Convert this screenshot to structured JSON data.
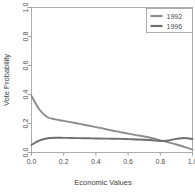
{
  "chart_data": {
    "type": "line",
    "title": "",
    "subtitle": "",
    "xlabel": "Economic Values",
    "ylabel": "Vote Probability",
    "xlim": [
      0.0,
      1.0
    ],
    "ylim": [
      0.0,
      1.0
    ],
    "grid": false,
    "legend_position": "top-right",
    "x_ticks": [
      "0.0",
      "0.2",
      "0.4",
      "0.6",
      "0.8",
      "1.0"
    ],
    "x_tick_values": [
      0.0,
      0.2,
      0.4,
      0.6,
      0.8,
      1.0
    ],
    "y_ticks": [
      "0.0",
      "0.2",
      "0.4",
      "0.6",
      "0.8",
      "1.0"
    ],
    "y_tick_values": [
      0.0,
      0.2,
      0.4,
      0.6,
      0.8,
      1.0
    ],
    "x": [
      0.0,
      0.05,
      0.1,
      0.15,
      0.2,
      0.25,
      0.3,
      0.35,
      0.4,
      0.45,
      0.5,
      0.55,
      0.6,
      0.65,
      0.7,
      0.75,
      0.8,
      0.85,
      0.9,
      0.95,
      1.0
    ],
    "series": [
      {
        "name": "1992",
        "color": "#8c8c8c",
        "values": [
          0.39,
          0.295,
          0.243,
          0.228,
          0.218,
          0.208,
          0.197,
          0.186,
          0.175,
          0.164,
          0.152,
          0.141,
          0.13,
          0.12,
          0.11,
          0.098,
          0.084,
          0.07,
          0.055,
          0.038,
          0.02
        ]
      },
      {
        "name": "1996",
        "color": "#6e6e6e",
        "values": [
          0.052,
          0.083,
          0.098,
          0.102,
          0.101,
          0.1,
          0.099,
          0.098,
          0.097,
          0.096,
          0.095,
          0.094,
          0.092,
          0.09,
          0.088,
          0.084,
          0.079,
          0.083,
          0.094,
          0.1,
          0.093
        ]
      }
    ]
  },
  "legend": {
    "entries": [
      {
        "label": "1992"
      },
      {
        "label": "1996"
      }
    ]
  },
  "axes": {
    "x_title": "Economic Values",
    "y_title": "Vote Probability"
  }
}
